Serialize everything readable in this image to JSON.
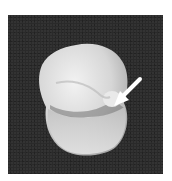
{
  "image": {
    "subject": "tooth-photograph",
    "background_color": "#2a2a2a",
    "tooth_color": "#d9d9d9",
    "arrow_color": "#ffffff",
    "annotation": "arrow-pointing-to-cusp"
  }
}
